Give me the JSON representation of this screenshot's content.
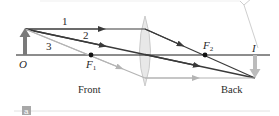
{
  "diagram": {
    "labels": {
      "object": "O",
      "image": "I",
      "focal_front": "F",
      "focal_front_sub": "1",
      "focal_back": "F",
      "focal_back_sub": "2",
      "ray1": "1",
      "ray2": "2",
      "ray3": "3",
      "front": "Front",
      "back": "Back",
      "panel": "a"
    },
    "colors": {
      "ray_dark": "#3a3a3a",
      "ray_light": "#b4b4b4",
      "object_arrow": "#7a7a7a",
      "image_arrow": "#b4b4b4",
      "lens_fill": "#e6e6e6",
      "lens_stroke": "#c8c8c8",
      "axis": "#1a1a1a"
    }
  }
}
